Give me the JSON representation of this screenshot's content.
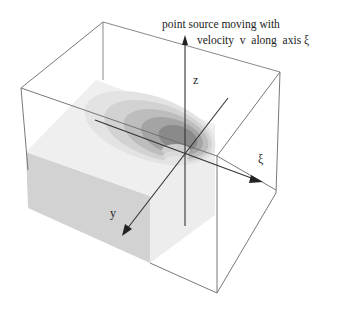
{
  "caption": {
    "line1": "point source moving with",
    "line2": "velocity  v  along  axis ξ"
  },
  "axes": {
    "z": "z",
    "xi": "ξ",
    "y": "y"
  },
  "colors": {
    "box_edge": "#6a6a6a",
    "axis": "#3a3a3a",
    "top_face": "#ececec",
    "front_face": "#cfcfcf",
    "contour_levels": [
      "#e2e2e2",
      "#cdcdcd",
      "#b4b4b4",
      "#9a9a9a",
      "#808080"
    ]
  }
}
